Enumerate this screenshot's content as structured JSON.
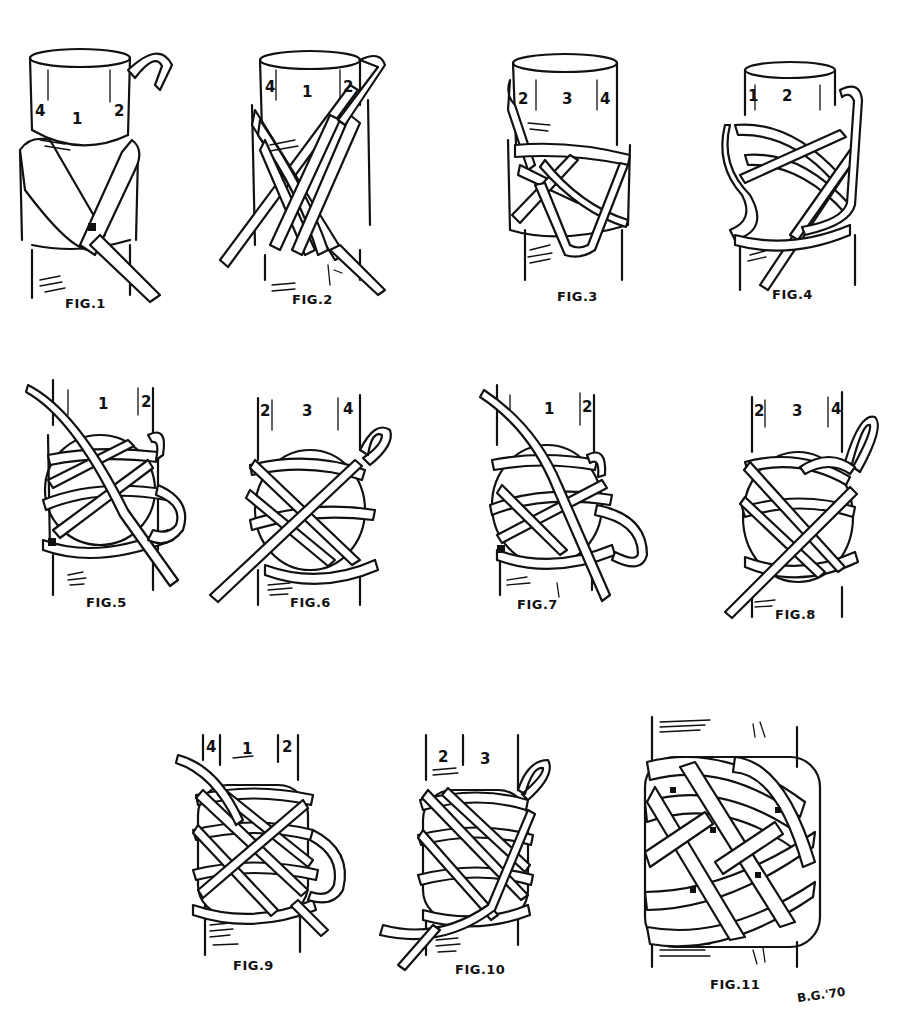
{
  "artist_signature": "B.G.'70",
  "figures": [
    {
      "id": 1,
      "label": "FIG.1",
      "section_numbers": [
        "4",
        "1",
        "2"
      ],
      "stage": "Initial crossing turns on cylinder end"
    },
    {
      "id": 2,
      "label": "FIG.2",
      "section_numbers": [
        "4",
        "1",
        "2"
      ],
      "stage": "Additional wraps fanned around"
    },
    {
      "id": 3,
      "label": "FIG.3",
      "section_numbers": [
        "2",
        "3",
        "4"
      ],
      "stage": "Rotated view, back side"
    },
    {
      "id": 4,
      "label": "FIG.4",
      "section_numbers": [
        "1",
        "2"
      ],
      "stage": "Loops tucked and crossed"
    },
    {
      "id": 5,
      "label": "FIG.5",
      "section_numbers": [
        "1",
        "2"
      ],
      "stage": "Weave forming, front"
    },
    {
      "id": 6,
      "label": "FIG.6",
      "section_numbers": [
        "2",
        "3",
        "4"
      ],
      "stage": "Weave forming, back"
    },
    {
      "id": 7,
      "label": "FIG.7",
      "section_numbers": [
        "1",
        "2"
      ],
      "stage": "Doubling begins, front"
    },
    {
      "id": 8,
      "label": "FIG.8",
      "section_numbers": [
        "2",
        "3",
        "4"
      ],
      "stage": "Doubling continues, back"
    },
    {
      "id": 9,
      "label": "FIG.9",
      "section_numbers": [
        "4",
        "1",
        "2"
      ],
      "stage": "Tripled weave, front"
    },
    {
      "id": 10,
      "label": "FIG.10",
      "section_numbers": [
        "2",
        "3"
      ],
      "stage": "Tripled weave, back"
    },
    {
      "id": 11,
      "label": "FIG.11",
      "section_numbers": [],
      "stage": "Finished knot"
    }
  ],
  "colors": {
    "ink": "#111111",
    "paper": "#ffffff"
  }
}
